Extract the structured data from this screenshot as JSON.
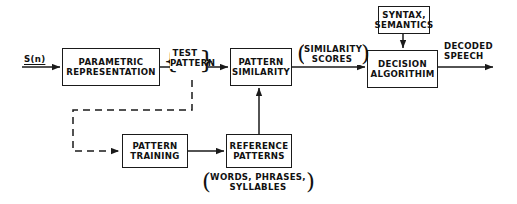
{
  "diagram": {
    "stroke_color": "#1a1a1a",
    "text_color": "#111111",
    "background": "#ffffff",
    "blocks": [
      {
        "id": "parametric",
        "line1": "PARAMETRIC",
        "line2": "REPRESENTATION"
      },
      {
        "id": "similarity",
        "line1": "PATTERN",
        "line2": "SIMILARITY"
      },
      {
        "id": "decision",
        "line1": "DECISION",
        "line2": "ALGORITHIM"
      },
      {
        "id": "syntax",
        "line1": "SYNTAX,",
        "line2": "SEMANTICS"
      },
      {
        "id": "training",
        "line1": "PATTERN",
        "line2": "TRAINING"
      },
      {
        "id": "reference",
        "line1": "REFERENCE",
        "line2": "PATTERNS"
      }
    ],
    "labels": {
      "input_signal": "S(n)",
      "test_pattern_line1": "TEST",
      "test_pattern_line2": "PATTERN",
      "similarity_scores_line1": "SIMILARITY",
      "similarity_scores_line2": "SCORES",
      "decoded_speech_line1": "DECODED",
      "decoded_speech_line2": "SPEECH",
      "reference_note_line1": "WORDS, PHRASES,",
      "reference_note_line2": "SYLLABLES",
      "brace_left": "{",
      "brace_right": "}",
      "paren_left": "(",
      "paren_right": ")"
    }
  }
}
